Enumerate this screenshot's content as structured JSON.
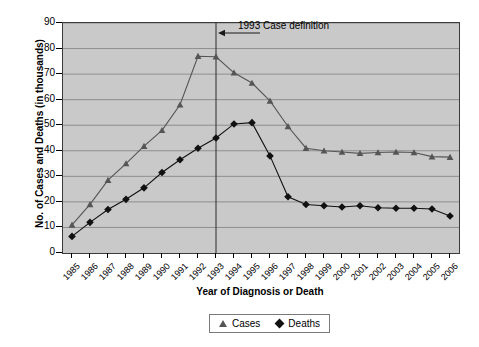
{
  "chart_data": {
    "type": "line",
    "title": "",
    "xlabel": "Year of Diagnosis or Death",
    "ylabel": "No. of Cases and Deaths (in thousands)",
    "ylim": [
      0,
      90
    ],
    "ytick_step": 10,
    "yticks": [
      90,
      80,
      70,
      60,
      50,
      40,
      30,
      20,
      10,
      0
    ],
    "grid": true,
    "legend_position": "bottom-center",
    "categories": [
      "1985",
      "1986",
      "1987",
      "1988",
      "1989",
      "1990",
      "1991",
      "1992",
      "1993",
      "1994",
      "1995",
      "1996",
      "1997",
      "1998",
      "1999",
      "2000",
      "2001",
      "2002",
      "2003",
      "2004",
      "2005",
      "2006"
    ],
    "series": [
      {
        "name": "Cases",
        "marker": "triangle",
        "color": "#555555",
        "values": [
          11.0,
          19.0,
          28.5,
          35.0,
          41.8,
          48.0,
          58.0,
          77.0,
          76.8,
          70.5,
          66.5,
          59.5,
          49.5,
          41.0,
          40.0,
          39.5,
          39.0,
          39.3,
          39.5,
          39.3,
          37.7,
          37.5
        ]
      },
      {
        "name": "Deaths",
        "marker": "diamond",
        "color": "#111111",
        "values": [
          6.5,
          12.0,
          17.0,
          21.0,
          25.5,
          31.5,
          36.5,
          41.0,
          45.0,
          50.5,
          51.0,
          38.0,
          22.0,
          19.0,
          18.5,
          18.0,
          18.5,
          17.7,
          17.5,
          17.5,
          17.2,
          14.5
        ]
      }
    ],
    "annotations": [
      {
        "text": "1993 Case definition",
        "at_category": "1993",
        "arrow": "left"
      }
    ]
  },
  "legend": {
    "items": [
      {
        "label": "Cases",
        "symbol": "triangle-marker"
      },
      {
        "label": "Deaths",
        "symbol": "diamond-marker"
      }
    ]
  }
}
